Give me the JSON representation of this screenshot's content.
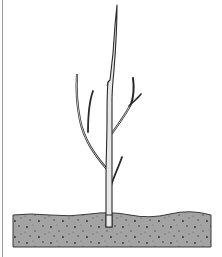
{
  "illustration": {
    "subject": "young tree sapling planted in soil",
    "caption": "Bare-root tree whip with side branches planted in ground",
    "colors": {
      "background": "#ffffff",
      "outline": "#2a2a2a",
      "trunk_fill": "#e8e8e8",
      "soil_fill": "#a3a3a3",
      "soil_speckle": "#333333",
      "frame_edge": "#9a9a9a"
    },
    "parts": {
      "trunk": "trunk",
      "leader": "central leader",
      "left_branch": "left branch",
      "right_branch": "right branch",
      "lower_twig": "lower twig",
      "soil": "soil"
    }
  }
}
